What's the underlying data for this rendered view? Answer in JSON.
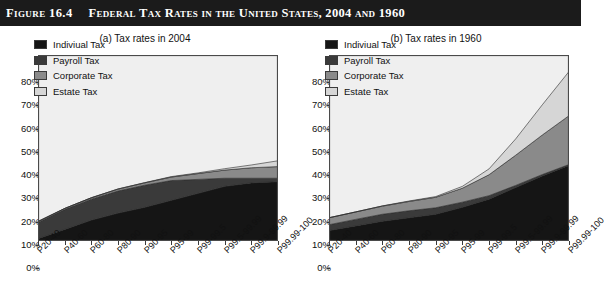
{
  "header": {
    "figure_number": "Figure 16.4",
    "title": "Federal Tax Rates in the United States, 2004 and 1960",
    "background_color": "#1b1b1b",
    "text_color": "#ffffff"
  },
  "panels": [
    {
      "id": "a",
      "title": "(a) Tax rates in 2004"
    },
    {
      "id": "b",
      "title": "(b) Tax rates in 1960"
    }
  ],
  "legend": {
    "position": "inside-top-left",
    "entries": [
      {
        "label": "Indiviual Tax",
        "color": "#151515"
      },
      {
        "label": "Payroll Tax",
        "color": "#3a3a3a"
      },
      {
        "label": "Corporate Tax",
        "color": "#8a8a8a"
      },
      {
        "label": "Estate Tax",
        "color": "#d6d6d6"
      }
    ]
  },
  "axes": {
    "y_ticks": [
      "0%",
      "10%",
      "20%",
      "30%",
      "40%",
      "50%",
      "60%",
      "70%",
      "80%"
    ],
    "y_min": 0,
    "y_max": 80,
    "y_step": 10,
    "x_categories": [
      "P20-40",
      "P40-60",
      "P60-80",
      "P80-90",
      "P90-95",
      "P95-99",
      "P99-99.5",
      "P99.5-99.99",
      "P99.9-99.99",
      "P99.99-100"
    ]
  },
  "chart_data": [
    {
      "type": "area",
      "stacked": true,
      "title": "(a) Tax rates in 2004",
      "xlabel": "",
      "ylabel": "",
      "ylim": [
        0,
        80
      ],
      "grid": false,
      "legend_position": "inside-top-left",
      "categories": [
        "P20-40",
        "P40-60",
        "P60-80",
        "P80-90",
        "P90-95",
        "P95-99",
        "P99-99.5",
        "P99.5-99.99",
        "P99.9-99.99",
        "P99.99-100"
      ],
      "series": [
        {
          "name": "Indiviual Tax",
          "color": "#151515",
          "values": [
            1.0,
            5.0,
            9.0,
            12.0,
            14.5,
            17.5,
            20.5,
            23.5,
            25.0,
            25.5
          ]
        },
        {
          "name": "Payroll Tax",
          "color": "#3a3a3a",
          "values": [
            7.0,
            8.5,
            9.0,
            9.5,
            9.5,
            8.5,
            6.0,
            3.5,
            2.0,
            1.5
          ]
        },
        {
          "name": "Corporate Tax",
          "color": "#8a8a8a",
          "values": [
            0.4,
            0.5,
            0.6,
            0.8,
            1.0,
            1.5,
            2.5,
            3.5,
            4.5,
            5.0
          ]
        },
        {
          "name": "Estate Tax",
          "color": "#d6d6d6",
          "values": [
            0.0,
            0.0,
            0.0,
            0.1,
            0.1,
            0.2,
            0.3,
            0.6,
            1.2,
            2.5
          ]
        }
      ],
      "totals": [
        8.4,
        14.0,
        18.6,
        22.4,
        25.1,
        27.7,
        29.3,
        31.1,
        32.7,
        34.5
      ]
    },
    {
      "type": "area",
      "stacked": true,
      "title": "(b) Tax rates in 1960",
      "xlabel": "",
      "ylabel": "",
      "ylim": [
        0,
        80
      ],
      "grid": false,
      "legend_position": "inside-top-left",
      "categories": [
        "P20-40",
        "P40-60",
        "P60-80",
        "P80-90",
        "P90-95",
        "P95-99",
        "P99-99.5",
        "P99.5-99.99",
        "P99.9-99.99",
        "P99.99-100"
      ],
      "series": [
        {
          "name": "Indiviual Tax",
          "color": "#151515",
          "values": [
            4.5,
            6.5,
            8.5,
            10.0,
            11.5,
            14.5,
            18.0,
            23.0,
            28.0,
            32.5
          ]
        },
        {
          "name": "Payroll Tax",
          "color": "#3a3a3a",
          "values": [
            2.5,
            2.8,
            3.0,
            3.0,
            2.8,
            2.2,
            1.5,
            0.9,
            0.6,
            0.4
          ]
        },
        {
          "name": "Corporate Tax",
          "color": "#8a8a8a",
          "values": [
            3.0,
            3.2,
            3.5,
            4.0,
            4.5,
            6.0,
            9.0,
            13.0,
            17.0,
            21.0
          ]
        },
        {
          "name": "Estate Tax",
          "color": "#d6d6d6",
          "values": [
            0.0,
            0.0,
            0.1,
            0.2,
            0.3,
            0.8,
            2.5,
            7.0,
            13.0,
            19.0
          ]
        }
      ],
      "totals": [
        10.0,
        12.5,
        15.1,
        17.2,
        19.1,
        23.5,
        31.0,
        43.9,
        58.6,
        72.9
      ]
    }
  ]
}
